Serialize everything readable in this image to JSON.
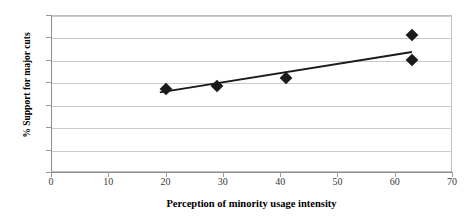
{
  "chart_data": {
    "type": "scatter",
    "title": "",
    "xlabel": "Perception of minority usage intensity",
    "ylabel": "% Support for major cuts",
    "xlim": [
      0,
      70
    ],
    "ylim": [
      0,
      70
    ],
    "xticks": [
      0,
      10,
      20,
      30,
      40,
      50,
      60,
      70
    ],
    "yticks": [
      0,
      10,
      20,
      30,
      40,
      50,
      60,
      70
    ],
    "grid": "horizontal",
    "legend": "none",
    "marker": "diamond",
    "marker_color": "#1a1a1a",
    "points": [
      {
        "x": 20,
        "y": 37
      },
      {
        "x": 29,
        "y": 38.5
      },
      {
        "x": 41,
        "y": 42
      },
      {
        "x": 63,
        "y": 61
      },
      {
        "x": 63,
        "y": 50
      }
    ],
    "trendline": {
      "type": "linear",
      "color": "#1a1a1a",
      "x_start": 19,
      "y_start": 35.5,
      "x_end": 63,
      "y_end": 53.5
    }
  },
  "axis": {
    "y_title": "% Support for major cuts",
    "x_title": "Perception of minority usage intensity",
    "y_tick_labels": [
      "70",
      "60",
      "50",
      "40",
      "30",
      "20",
      "10",
      "0"
    ],
    "x_tick_labels": [
      "0",
      "10",
      "20",
      "30",
      "40",
      "50",
      "60",
      "70"
    ]
  },
  "colors": {
    "marker": "#1a1a1a",
    "trendline": "#1a1a1a",
    "gridline": "#c9c9c9",
    "axis": "#8d8d8d",
    "border": "#bfbfbf",
    "background": "#ffffff",
    "tick_text": "#3a3a3a",
    "title_text": "#000000"
  }
}
